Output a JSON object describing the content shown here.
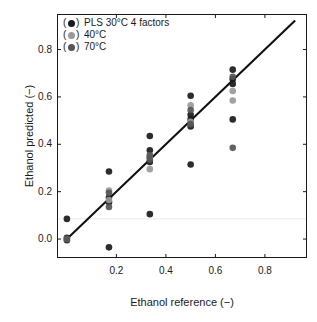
{
  "chart_data": {
    "type": "scatter",
    "title": "",
    "xlabel": "Ethanol reference (−)",
    "ylabel": "Ethanol predicted (−)",
    "xlim": [
      -0.04,
      0.97
    ],
    "ylim": [
      -0.08,
      0.95
    ],
    "xticks": [
      0.2,
      0.4,
      0.6,
      0.8
    ],
    "xticklabels": [
      "0.2",
      "0.4",
      "0.6",
      "0.8"
    ],
    "yticks": [
      0.0,
      0.2,
      0.4,
      0.6,
      0.8
    ],
    "yticklabels": [
      "0.0",
      "0.2",
      "0.4",
      "0.6",
      "0.8"
    ],
    "grid": false,
    "legend_position": "upper left",
    "reference_line": {
      "name": "1:1 identity line",
      "from": [
        0.0,
        0.0
      ],
      "to": [
        0.92,
        0.92
      ],
      "color": "#111111"
    },
    "faint_gridline_y": 0.085,
    "colors": {
      "30C": "#1a1a1a",
      "40C": "#9a9a9a",
      "70C": "#555555",
      "line": "#111111",
      "axis": "#1a1a1a"
    },
    "series": [
      {
        "name": "PLS 30°C 4 factors",
        "color": "#1a1a1a",
        "marker": "o",
        "points": [
          [
            0.0,
            0.085
          ],
          [
            0.0,
            0.005
          ],
          [
            0.0,
            -0.005
          ],
          [
            0.17,
            0.285
          ],
          [
            0.17,
            0.175
          ],
          [
            0.17,
            0.155
          ],
          [
            0.17,
            -0.035
          ],
          [
            0.335,
            0.435
          ],
          [
            0.335,
            0.375
          ],
          [
            0.335,
            0.345
          ],
          [
            0.335,
            0.325
          ],
          [
            0.335,
            0.105
          ],
          [
            0.5,
            0.605
          ],
          [
            0.5,
            0.525
          ],
          [
            0.5,
            0.505
          ],
          [
            0.5,
            0.475
          ],
          [
            0.5,
            0.315
          ],
          [
            0.67,
            0.715
          ],
          [
            0.67,
            0.675
          ],
          [
            0.67,
            0.655
          ],
          [
            0.67,
            0.505
          ]
        ]
      },
      {
        "name": "40°C",
        "color": "#9a9a9a",
        "marker": "o",
        "points": [
          [
            0.0,
            0.0
          ],
          [
            0.17,
            0.205
          ],
          [
            0.17,
            0.165
          ],
          [
            0.335,
            0.345
          ],
          [
            0.335,
            0.295
          ],
          [
            0.5,
            0.565
          ],
          [
            0.5,
            0.495
          ],
          [
            0.67,
            0.625
          ],
          [
            0.67,
            0.585
          ]
        ]
      },
      {
        "name": "70°C",
        "color": "#555555",
        "marker": "o",
        "points": [
          [
            0.0,
            0.0
          ],
          [
            0.17,
            0.195
          ],
          [
            0.17,
            0.135
          ],
          [
            0.335,
            0.355
          ],
          [
            0.335,
            0.335
          ],
          [
            0.5,
            0.545
          ],
          [
            0.5,
            0.485
          ],
          [
            0.67,
            0.685
          ],
          [
            0.67,
            0.385
          ]
        ]
      }
    ]
  },
  "legend": {
    "items": [
      {
        "label": "PLS 30°C 4 factors",
        "color": "#1a1a1a"
      },
      {
        "label": "40°C",
        "color": "#9a9a9a"
      },
      {
        "label": "70°C",
        "color": "#555555"
      }
    ],
    "open_paren": "(",
    "close_paren": ")"
  },
  "axes": {
    "x_title": "Ethanol reference (−)",
    "y_title": "Ethanol predicted (−)",
    "x_tick_labels": [
      "0.2",
      "0.4",
      "0.6",
      "0.8"
    ],
    "y_tick_labels": [
      "0.0",
      "0.2",
      "0.4",
      "0.6",
      "0.8"
    ]
  }
}
